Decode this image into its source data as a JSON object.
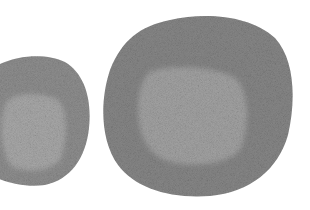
{
  "image": {
    "subject": "Two grayscale cells under microscopy, each with a lighter central nucleus",
    "background_color": "#ffffff",
    "cells": [
      {
        "name": "left-cell",
        "cytoplasm_color": "#8f8f8f",
        "nucleus_color": "#a9a9a9",
        "partially_cropped": true
      },
      {
        "name": "right-cell",
        "cytoplasm_color": "#878787",
        "nucleus_color": "#a3a3a3",
        "partially_cropped": false
      }
    ]
  }
}
